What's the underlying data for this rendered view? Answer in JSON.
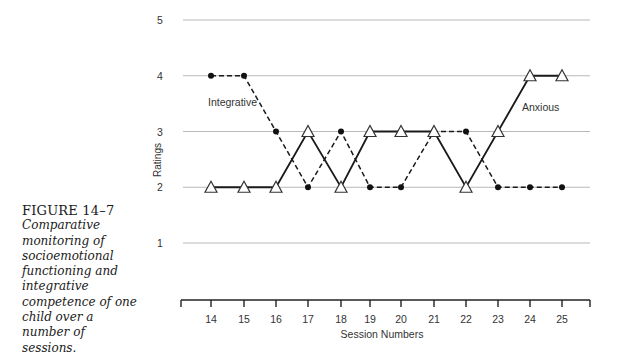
{
  "caption": {
    "figure_label": "FIGURE 14–7",
    "text": "Comparative\nmonitoring of\nsocioemotional\nfunctioning and\nintegrative\ncompetence of one\nchild over a\nnumber of\nsessions."
  },
  "chart_data": {
    "type": "line",
    "title": "",
    "xlabel": "Session Numbers",
    "ylabel": "Ratings",
    "x": [
      14,
      15,
      16,
      17,
      18,
      19,
      20,
      21,
      22,
      23,
      24,
      25
    ],
    "yticks": [
      1,
      2,
      3,
      4,
      5
    ],
    "ylim": [
      1,
      5
    ],
    "grid": true,
    "series": [
      {
        "name": "Integrative",
        "style": "dashed",
        "marker": "filled-circle",
        "values": [
          4,
          4,
          3,
          2,
          3,
          2,
          2,
          3,
          3,
          2,
          2,
          2
        ]
      },
      {
        "name": "Anxious",
        "style": "solid",
        "marker": "open-triangle",
        "values": [
          2,
          2,
          2,
          3,
          2,
          3,
          3,
          3,
          2,
          3,
          4,
          4
        ]
      }
    ],
    "annotations": [
      {
        "text": "Integrative",
        "near_x": 15,
        "near_y": 3.5
      },
      {
        "text": "Anxious",
        "near_x": 24,
        "near_y": 3.55
      }
    ]
  }
}
